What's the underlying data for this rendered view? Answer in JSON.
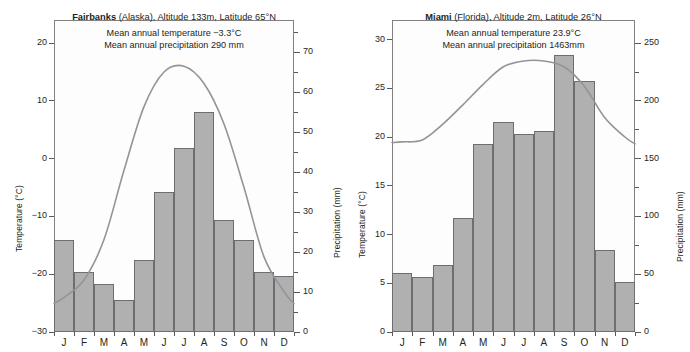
{
  "figure": {
    "panels": [
      {
        "id": "fairbanks",
        "city": "Fairbanks",
        "head_rest": " (Alaska), Altitude 133m, Latitude 65°N",
        "sub1": "Mean annual temperature −3.3°C",
        "sub2": "Mean annual precipitation 290 mm",
        "left_axis_title": "Temperature (°C)",
        "right_axis_title": "Precipitation (mm)",
        "left_ticks": [
          "20",
          "10",
          "0",
          "−10",
          "−20",
          "−30"
        ],
        "right_ticks": [
          "70",
          "60",
          "50",
          "40",
          "30",
          "20",
          "10",
          "0"
        ],
        "months": [
          "J",
          "F",
          "M",
          "A",
          "M",
          "J",
          "J",
          "A",
          "S",
          "O",
          "N",
          "D"
        ]
      },
      {
        "id": "miami",
        "city": "Miami",
        "head_rest": " (Florida), Altitude 2m, Latitude 26°N",
        "sub1": "Mean annual temperature 23.9°C",
        "sub2": "Mean annual precipitation 1463mm",
        "left_axis_title": "Temperature (°C)",
        "right_axis_title": "Precipitation (mm)",
        "left_ticks": [
          "30",
          "25",
          "20",
          "15",
          "10",
          "5",
          "0"
        ],
        "right_ticks": [
          "250",
          "200",
          "150",
          "100",
          "50",
          "0"
        ],
        "months": [
          "J",
          "F",
          "M",
          "A",
          "M",
          "J",
          "J",
          "A",
          "S",
          "O",
          "N",
          "D"
        ]
      }
    ]
  },
  "chart_data": [
    {
      "type": "bar",
      "id": "fairbanks",
      "title": "Fairbanks (Alaska), Altitude 133m, Latitude 65°N",
      "subtitle": "Mean annual temperature −3.3°C / Mean annual precipitation 290 mm",
      "categories": [
        "J",
        "F",
        "M",
        "A",
        "M",
        "J",
        "J",
        "A",
        "S",
        "O",
        "N",
        "D"
      ],
      "xlabel": "",
      "ylabel": "Temperature (°C)",
      "y2label": "Precipitation (mm)",
      "ylim": [
        -30,
        24
      ],
      "y2lim": [
        0,
        78
      ],
      "ytick_values": [
        20,
        10,
        0,
        -10,
        -20,
        -30
      ],
      "y2tick_values": [
        70,
        60,
        50,
        40,
        30,
        20,
        10,
        0
      ],
      "y2_minor_step": 5,
      "grid": false,
      "legend": "none",
      "series": [
        {
          "name": "Precipitation",
          "kind": "bar",
          "axis": "right",
          "unit": "mm",
          "values": [
            23,
            15,
            12,
            8,
            18,
            35,
            46,
            55,
            28,
            23,
            15,
            14
          ]
        },
        {
          "name": "Temperature",
          "kind": "line",
          "axis": "left",
          "unit": "°C",
          "values": [
            -24.0,
            -21.0,
            -14.0,
            -2.0,
            9.0,
            15.0,
            16.0,
            13.0,
            6.0,
            -5.0,
            -17.0,
            -23.0
          ]
        }
      ],
      "annotations": {
        "mean_annual_temperature_c": -3.3,
        "mean_annual_precipitation_mm": 290,
        "altitude_m": 133,
        "latitude": "65°N",
        "region": "Alaska"
      }
    },
    {
      "type": "bar",
      "id": "miami",
      "title": "Miami (Florida), Altitude 2m, Latitude 26°N",
      "subtitle": "Mean annual temperature 23.9°C / Mean annual precipitation 1463mm",
      "categories": [
        "J",
        "F",
        "M",
        "A",
        "M",
        "J",
        "J",
        "A",
        "S",
        "O",
        "N",
        "D"
      ],
      "xlabel": "",
      "ylabel": "Temperature (°C)",
      "y2label": "Precipitation (mm)",
      "ylim": [
        0,
        32
      ],
      "y2lim": [
        0,
        270
      ],
      "ytick_values": [
        30,
        25,
        20,
        15,
        10,
        5,
        0
      ],
      "y2tick_values": [
        250,
        200,
        150,
        100,
        50,
        0
      ],
      "y2_minor_step": 25,
      "grid": false,
      "legend": "none",
      "series": [
        {
          "name": "Precipitation",
          "kind": "bar",
          "axis": "right",
          "unit": "mm",
          "values": [
            51,
            48,
            58,
            99,
            163,
            182,
            171,
            174,
            240,
            217,
            71,
            43
          ]
        },
        {
          "name": "Temperature",
          "kind": "line",
          "axis": "left",
          "unit": "°C",
          "values": [
            19.5,
            19.7,
            21.3,
            23.3,
            25.4,
            27.2,
            27.8,
            27.8,
            27.2,
            25.2,
            22.0,
            20.0
          ]
        }
      ],
      "annotations": {
        "mean_annual_temperature_c": 23.9,
        "mean_annual_precipitation_mm": 1463,
        "altitude_m": 2,
        "latitude": "26°N",
        "region": "Florida"
      }
    }
  ],
  "style": {
    "bar_fill": "#b0b0b0",
    "bar_stroke": "#6d6e71",
    "curve_stroke": "#929497",
    "frame_stroke": "#808080",
    "text_color": "#231f20",
    "plot_bg": "#fdfdfd"
  }
}
